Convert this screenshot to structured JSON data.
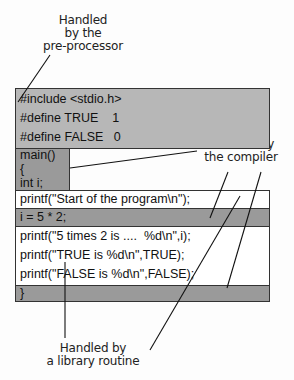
{
  "labels": {
    "preprocessor": [
      "Handled",
      "by the",
      "pre-processor"
    ],
    "compiler": [
      "Handled by",
      "the compiler"
    ],
    "library": [
      "Handled by",
      "a library routine"
    ]
  },
  "code": {
    "preprocessor": [
      "#include <stdio.h>",
      "#define TRUE    1",
      "#define FALSE   0"
    ],
    "main_block": [
      "main()",
      "{",
      "int i;"
    ],
    "printf_start": "printf(\"Start of the program\\n\");",
    "assign": "i = 5 * 2;",
    "printf_block": [
      "printf(\"5 times 2 is ....  %d\\n\",i);",
      "printf(\"TRUE is %d\\n\",TRUE);",
      "printf(\"FALSE is %d\\n\",FALSE);"
    ],
    "close": "}"
  },
  "colors": {
    "preprocessor_fill": "#b7b7b7",
    "compiler_fill": "#9a9a9a",
    "library_fill": "#ffffff"
  }
}
